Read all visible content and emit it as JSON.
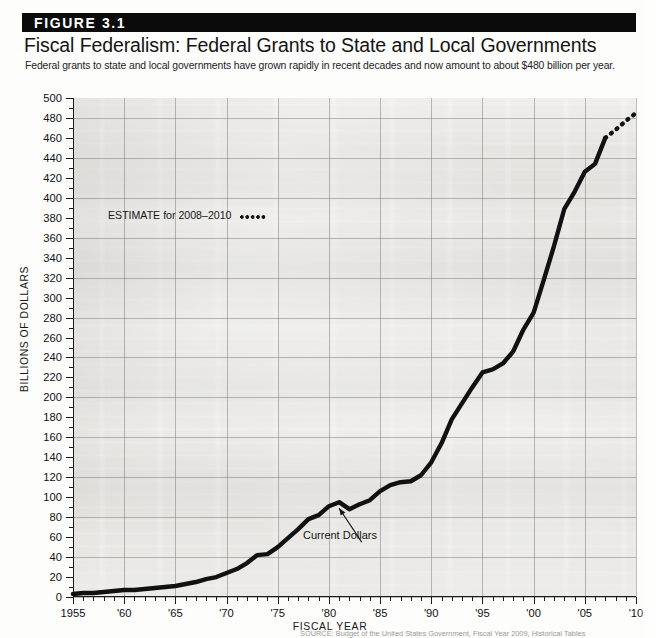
{
  "figure": {
    "banner_label": "FIGURE 3.1",
    "title": "Fiscal Federalism: Federal Grants to State and Local Governments",
    "subtitle": "Federal grants to state and local governments have grown rapidly in recent decades and now amount to about $480 billion per year.",
    "source_note": "SOURCE: Budget of the United States Government, Fiscal Year 2009, Historical Tables"
  },
  "annotations": {
    "estimate_label": "ESTIMATE for 2008–2010",
    "series_label": "Current Dollars"
  },
  "colors": {
    "banner_bg": "#0b0b0b",
    "banner_text": "#ffffff",
    "line": "#111111",
    "axis": "#1c1c1c",
    "grid": "#6e6c68",
    "plot_bg": "#dedcd7"
  },
  "chart_data": {
    "type": "line",
    "title": "Fiscal Federalism: Federal Grants to State and Local Governments",
    "xlabel": "FISCAL YEAR",
    "ylabel": "BILLIONS OF DOLLARS",
    "xlim": [
      1955,
      2010
    ],
    "ylim": [
      0,
      500
    ],
    "ytick_step": 20,
    "yticks": [
      0,
      20,
      40,
      60,
      80,
      100,
      120,
      140,
      160,
      180,
      200,
      220,
      240,
      260,
      280,
      300,
      320,
      340,
      360,
      380,
      400,
      420,
      440,
      460,
      480,
      500
    ],
    "ytick_labels": [
      "0",
      "20",
      "40",
      "60",
      "80",
      "100",
      "120",
      "140",
      "160",
      "180",
      "200",
      "220",
      "240",
      "260",
      "280",
      "300",
      "320",
      "340",
      "360",
      "380",
      "400",
      "420",
      "440",
      "460",
      "480",
      "500"
    ],
    "xticks": [
      1955,
      1960,
      1965,
      1970,
      1975,
      1980,
      1985,
      1990,
      1995,
      2000,
      2005,
      2010
    ],
    "xtick_labels": [
      "1955",
      "'60",
      "'65",
      "'70",
      "'75",
      "'80",
      "'85",
      "'90",
      "'95",
      "'00",
      "'05",
      "'10"
    ],
    "grid": true,
    "legend": "none",
    "series": [
      {
        "name": "Current Dollars",
        "style": "solid",
        "x": [
          1955,
          1956,
          1957,
          1958,
          1959,
          1960,
          1961,
          1962,
          1963,
          1964,
          1965,
          1966,
          1967,
          1968,
          1969,
          1970,
          1971,
          1972,
          1973,
          1974,
          1975,
          1976,
          1977,
          1978,
          1979,
          1980,
          1981,
          1982,
          1983,
          1984,
          1985,
          1986,
          1987,
          1988,
          1989,
          1990,
          1991,
          1992,
          1993,
          1994,
          1995,
          1996,
          1997,
          1998,
          1999,
          2000,
          2001,
          2002,
          2003,
          2004,
          2005,
          2006,
          2007
        ],
        "values": [
          3,
          4,
          4,
          5,
          6,
          7,
          7,
          8,
          9,
          10,
          11,
          13,
          15,
          18,
          20,
          24,
          28,
          34,
          42,
          43,
          50,
          59,
          68,
          78,
          82,
          91,
          95,
          88,
          93,
          97,
          106,
          112,
          115,
          116,
          122,
          135,
          154,
          178,
          194,
          210,
          225,
          228,
          234,
          246,
          268,
          285,
          318,
          352,
          389,
          406,
          426,
          434,
          460
        ]
      },
      {
        "name": "ESTIMATE for 2008–2010",
        "style": "dotted",
        "x": [
          2007,
          2008,
          2009,
          2010
        ],
        "values": [
          460,
          468,
          477,
          485
        ]
      }
    ]
  }
}
